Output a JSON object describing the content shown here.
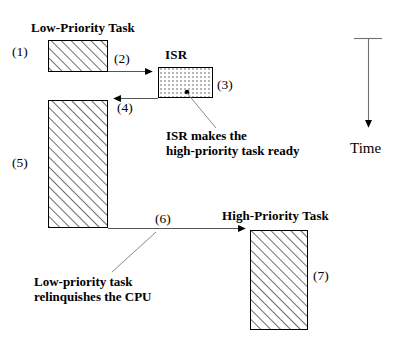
{
  "diagram": {
    "title_low": "Low-Priority Task",
    "title_isr": "ISR",
    "title_high": "High-Priority Task",
    "steps": {
      "s1": "(1)",
      "s2": "(2)",
      "s3": "(3)",
      "s4": "(4)",
      "s5": "(5)",
      "s6": "(6)",
      "s7": "(7)"
    },
    "captions": {
      "isr_line1": "ISR makes the",
      "isr_line2": "high-priority task ready",
      "relinquish_line1": "Low-priority task",
      "relinquish_line2": "relinquishes the CPU"
    },
    "axis": {
      "label": "Time"
    },
    "colors": {
      "stroke": "#000000",
      "hatch": "#555555",
      "dotfill": "#3a3a3a",
      "background": "#ffffff",
      "leader": "#7a7a7a"
    }
  }
}
